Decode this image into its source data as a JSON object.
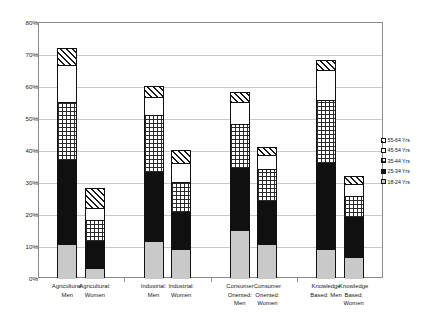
{
  "chart_data": {
    "type": "bar",
    "subtype": "stacked-column",
    "title": "",
    "xlabel": "",
    "ylabel": "Proportion Business Creations by Sector",
    "ylim": [
      0,
      80
    ],
    "ytick_labels": [
      "0%",
      "10%",
      "20%",
      "30%",
      "40%",
      "50%",
      "60%",
      "70%",
      "80%"
    ],
    "ytick_values": [
      0,
      10,
      20,
      30,
      40,
      50,
      60,
      70,
      80
    ],
    "grid": true,
    "legend_position": "right",
    "categories": [
      "Agricultural: Men",
      "Agricultural: Women",
      "Industrial: Men",
      "Industrial: Women",
      "Consumer Oriented: Men",
      "Consumer Oriented: Women",
      "Knowledge Based: Men",
      "Knowledge Based: Women"
    ],
    "category_lines": [
      [
        "Agricultural:",
        "Men"
      ],
      [
        "Agricultural:",
        "Women"
      ],
      [
        "Industrial:",
        "Men"
      ],
      [
        "Industrial:",
        "Women"
      ],
      [
        "Consumer",
        "Oriented:",
        "Men"
      ],
      [
        "Consumer",
        "Oriented:",
        "Women"
      ],
      [
        "Knowledge",
        "Based: Men"
      ],
      [
        "Knowledge",
        "Based:",
        "Women"
      ]
    ],
    "series": [
      {
        "name": "18-24 Yrs",
        "pattern": "solid-light-gray",
        "color": "#c9c9c9",
        "values": [
          10.5,
          3.0,
          11.5,
          9.0,
          15.0,
          10.5,
          9.0,
          6.5
        ]
      },
      {
        "name": "25-34 Yrs",
        "pattern": "solid-black",
        "color": "#101010",
        "values": [
          26.5,
          8.5,
          21.5,
          11.5,
          19.5,
          13.5,
          27.0,
          12.5
        ]
      },
      {
        "name": "35-44 Yrs",
        "pattern": "checkered",
        "color": "#ffffff",
        "values": [
          18.0,
          6.5,
          18.0,
          9.5,
          13.5,
          10.0,
          19.5,
          6.5
        ]
      },
      {
        "name": "45-54 Yrs",
        "pattern": "solid-white",
        "color": "#ffffff",
        "values": [
          11.5,
          4.0,
          5.5,
          6.0,
          7.0,
          4.5,
          9.5,
          4.0
        ]
      },
      {
        "name": "55-64 Yrs",
        "pattern": "diagonal-hatch",
        "color": "#ffffff",
        "values": [
          5.5,
          6.0,
          3.5,
          4.0,
          3.0,
          2.5,
          3.0,
          2.5
        ]
      }
    ],
    "totals": [
      72.0,
      28.0,
      60.0,
      40.0,
      58.0,
      41.0,
      68.0,
      32.0
    ],
    "legend_entries": [
      "55-64 Yrs",
      "45-54 Yrs",
      "35-44 Yrs",
      "25-34 Yrs",
      "18-24 Yrs"
    ]
  }
}
